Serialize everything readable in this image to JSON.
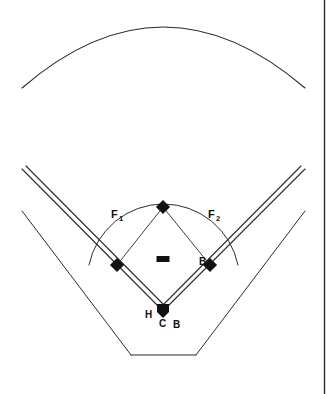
{
  "figure": {
    "background_color": "#ffffff",
    "line_color": "#2b2b2b",
    "marker_color": "#111111",
    "width": 331,
    "height": 394
  },
  "labels": {
    "fair_territory_left": {
      "text": "F",
      "subscript": "1",
      "x": 116,
      "y": 214
    },
    "fair_territory_right": {
      "text": "F",
      "subscript": "2",
      "x": 212,
      "y": 214
    },
    "base_right": {
      "text": "B",
      "x": 205,
      "y": 263
    },
    "home_left": {
      "text": "H",
      "x": 148,
      "y": 317
    },
    "catcher": {
      "text": "C",
      "x": 159,
      "y": 326
    },
    "batter": {
      "text": "B",
      "x": 175,
      "y": 327
    }
  },
  "markers": {
    "second_base": {
      "name": "second-base",
      "x": 163,
      "y": 207
    },
    "third_base": {
      "name": "third-base",
      "x": 117,
      "y": 265
    },
    "first_base": {
      "name": "first-base",
      "x": 210,
      "y": 265
    },
    "home_plate": {
      "name": "home-plate",
      "x": 163,
      "y": 311
    },
    "pitchers_rubber": {
      "name": "pitchers-rubber",
      "x": 163,
      "y": 259,
      "w": 13,
      "h": 6
    }
  },
  "geometry": {
    "outfield_fence": "M 22 88 Q 163 -34 305 88",
    "infield_arc": "M 89 265 A 76 76 0 0 1 238 265",
    "foul_line_left_outer": "M 22 169 L 163 311",
    "foul_line_left_inner": "M 26 166 L 167 308",
    "foul_line_right_outer": "M 305 169 L 163 311",
    "foul_line_right_inner": "M 301 166 L 160 308",
    "stands_left": "M 22 211 L 131 355",
    "stands_right": "M 305 211 L 196 355",
    "backstop_bottom": "M 131 355 L 196 355"
  }
}
